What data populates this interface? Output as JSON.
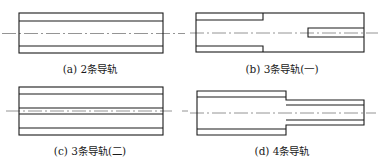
{
  "figures": [
    {
      "id": "a",
      "caption": "(a) 2条导轨",
      "caption_pos": {
        "x": 90,
        "y": 63
      }
    },
    {
      "id": "b",
      "caption": "(b) 3条导轨(一)",
      "caption_pos": {
        "x": 282,
        "y": 63
      }
    },
    {
      "id": "c",
      "caption": "(c) 3条导轨(二)",
      "caption_pos": {
        "x": 90,
        "y": 145
      }
    },
    {
      "id": "d",
      "caption": "(d) 4条导轨",
      "caption_pos": {
        "x": 282,
        "y": 145
      }
    }
  ],
  "colors": {
    "line": "#1a1a1a",
    "centerline": "#7a7a7a",
    "background": "#ffffff"
  }
}
